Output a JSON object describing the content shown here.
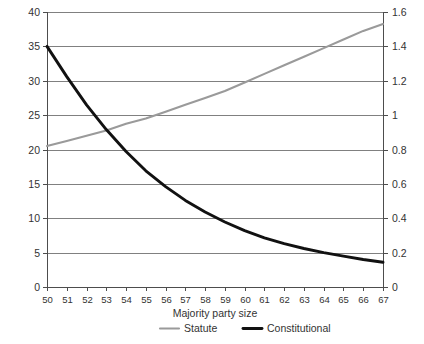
{
  "chart_data": {
    "type": "line",
    "title": "",
    "subtitle": "",
    "xlabel": "Majority party size",
    "ylabel": "",
    "y2label": "",
    "grid": true,
    "legend_position": "bottom",
    "x": [
      50,
      51,
      52,
      53,
      54,
      55,
      56,
      57,
      58,
      59,
      60,
      61,
      62,
      63,
      64,
      65,
      66,
      67
    ],
    "xlim": [
      50,
      67
    ],
    "xticks": [
      50,
      51,
      52,
      53,
      54,
      55,
      56,
      57,
      58,
      59,
      60,
      61,
      62,
      63,
      64,
      65,
      66,
      67
    ],
    "xtick_labels": [
      "50",
      "51",
      "52",
      "53",
      "54",
      "55",
      "56",
      "57",
      "58",
      "59",
      "60",
      "61",
      "62",
      "63",
      "64",
      "65",
      "66",
      "67"
    ],
    "ylim": [
      0,
      40
    ],
    "yticks": [
      0,
      5,
      10,
      15,
      20,
      25,
      30,
      35,
      40
    ],
    "ytick_labels": [
      "0",
      "5",
      "10",
      "15",
      "20",
      "25",
      "30",
      "35",
      "40"
    ],
    "y2lim": [
      0,
      1.6
    ],
    "y2ticks": [
      0,
      0.2,
      0.4,
      0.6,
      0.8,
      1.0,
      1.2,
      1.4,
      1.6
    ],
    "y2tick_labels": [
      "0",
      "0.2",
      "0.4",
      "0.6",
      "0.8",
      "1",
      "1.2",
      "1.4",
      "1.6"
    ],
    "series": [
      {
        "name": "Statute",
        "axis": "right",
        "color": "#9a9a9a",
        "width": 2.1,
        "values": [
          0.82,
          0.85,
          0.88,
          0.91,
          0.95,
          0.98,
          1.02,
          1.06,
          1.1,
          1.14,
          1.19,
          1.24,
          1.29,
          1.34,
          1.39,
          1.44,
          1.49,
          1.53
        ]
      },
      {
        "name": "Constitutional",
        "axis": "left",
        "color": "#111111",
        "width": 2.9,
        "values": [
          35.0,
          30.6,
          26.5,
          22.9,
          19.7,
          16.9,
          14.6,
          12.6,
          10.9,
          9.45,
          8.2,
          7.15,
          6.3,
          5.6,
          5.0,
          4.5,
          4.0,
          3.6
        ]
      }
    ],
    "legend": [
      {
        "label": "Statute",
        "color": "#9a9a9a",
        "width": 2.1
      },
      {
        "label": "Constitutional",
        "color": "#111111",
        "width": 2.9
      }
    ]
  },
  "layout": {
    "plot_left": 47,
    "plot_right": 383,
    "plot_top": 12,
    "plot_bottom": 287
  }
}
